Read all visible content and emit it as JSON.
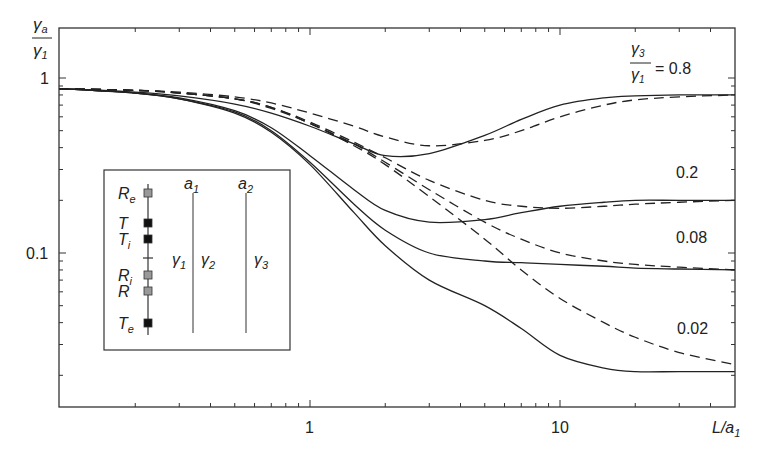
{
  "chart_data": {
    "type": "line",
    "title": "",
    "xlabel": "L/a1",
    "ylabel": "γa/γ1",
    "xscale": "log",
    "yscale": "log",
    "xlim": [
      0.1,
      50
    ],
    "ylim": [
      0.013,
      1.9
    ],
    "x_ticks": [
      "1",
      "10"
    ],
    "y_ticks": [
      "1",
      "0.1"
    ],
    "grid": false,
    "legend_title": "γ3/γ1 =",
    "x": [
      0.1,
      0.2,
      0.3,
      0.5,
      0.7,
      1,
      1.5,
      2,
      3,
      5,
      7,
      10,
      15,
      20,
      30,
      50
    ],
    "series": [
      {
        "name": "γ3/γ1 = 0.8 (solid)",
        "style": "solid",
        "values": [
          0.87,
          0.83,
          0.79,
          0.71,
          0.63,
          0.53,
          0.42,
          0.36,
          0.37,
          0.47,
          0.58,
          0.7,
          0.77,
          0.79,
          0.8,
          0.8
        ]
      },
      {
        "name": "γ3/γ1 = 0.8 (dashed)",
        "style": "dashed",
        "values": [
          0.87,
          0.85,
          0.83,
          0.78,
          0.72,
          0.63,
          0.53,
          0.46,
          0.41,
          0.44,
          0.5,
          0.6,
          0.7,
          0.75,
          0.78,
          0.8
        ]
      },
      {
        "name": "γ3/γ1 = 0.2 (solid)",
        "style": "solid",
        "values": [
          0.87,
          0.82,
          0.77,
          0.65,
          0.52,
          0.36,
          0.23,
          0.175,
          0.15,
          0.155,
          0.17,
          0.185,
          0.195,
          0.2,
          0.2,
          0.2
        ]
      },
      {
        "name": "γ3/γ1 = 0.2 (dashed)",
        "style": "dashed",
        "values": [
          0.87,
          0.85,
          0.82,
          0.76,
          0.68,
          0.56,
          0.43,
          0.35,
          0.26,
          0.2,
          0.185,
          0.18,
          0.185,
          0.19,
          0.195,
          0.2
        ]
      },
      {
        "name": "γ3/γ1 = 0.08 (solid)",
        "style": "solid",
        "values": [
          0.87,
          0.82,
          0.76,
          0.64,
          0.5,
          0.33,
          0.19,
          0.135,
          0.1,
          0.09,
          0.088,
          0.086,
          0.084,
          0.082,
          0.081,
          0.08
        ]
      },
      {
        "name": "γ3/γ1 = 0.08 (dashed)",
        "style": "dashed",
        "values": [
          0.87,
          0.85,
          0.82,
          0.76,
          0.68,
          0.55,
          0.42,
          0.33,
          0.23,
          0.15,
          0.12,
          0.1,
          0.09,
          0.086,
          0.083,
          0.08
        ]
      },
      {
        "name": "γ3/γ1 = 0.02 (solid)",
        "style": "solid",
        "values": [
          0.87,
          0.82,
          0.76,
          0.63,
          0.49,
          0.32,
          0.17,
          0.11,
          0.07,
          0.05,
          0.037,
          0.026,
          0.022,
          0.021,
          0.021,
          0.021
        ]
      },
      {
        "name": "γ3/γ1 = 0.02 (dashed)",
        "style": "dashed",
        "values": [
          0.87,
          0.85,
          0.82,
          0.76,
          0.67,
          0.55,
          0.41,
          0.32,
          0.21,
          0.12,
          0.08,
          0.055,
          0.04,
          0.033,
          0.027,
          0.023
        ]
      }
    ],
    "annotations": [
      "γ3/γ1 = 0.8",
      "0.2",
      "0.08",
      "0.02"
    ],
    "inset": {
      "markers": [
        {
          "label": "Re",
          "fill": "gray"
        },
        {
          "label": "T",
          "fill": "black"
        },
        {
          "label": "Ti",
          "fill": "black"
        },
        {
          "label": "Ri",
          "fill": "gray"
        },
        {
          "label": "R",
          "fill": "gray"
        },
        {
          "label": "Te",
          "fill": "black"
        }
      ],
      "boundaries": [
        "a1",
        "a2"
      ],
      "regions": [
        "γ1",
        "γ2",
        "γ3"
      ]
    }
  },
  "labels": {
    "y_num": "γ",
    "y_num_sub": "a",
    "y_den": "γ",
    "y_den_sub": "1",
    "x_main": "L/a",
    "x_sub": "1",
    "x_tick_1": "1",
    "x_tick_10": "10",
    "y_tick_1": "1",
    "y_tick_01": "0.1",
    "legend_num": "γ",
    "legend_num_sub": "3",
    "legend_den": "γ",
    "legend_den_sub": "1",
    "legend_eq": "= 0.8",
    "ann_02": "0.2",
    "ann_008": "0.08",
    "ann_002": "0.02"
  },
  "inset": {
    "marker_labels": [
      {
        "main": "R",
        "sub": "e"
      },
      {
        "main": "T",
        "sub": ""
      },
      {
        "main": "T",
        "sub": "i"
      },
      {
        "main": "R",
        "sub": "i"
      },
      {
        "main": "R",
        "sub": ""
      },
      {
        "main": "T",
        "sub": "e"
      }
    ],
    "a1": {
      "main": "a",
      "sub": "1"
    },
    "a2": {
      "main": "a",
      "sub": "2"
    },
    "g1": {
      "main": "γ",
      "sub": "1"
    },
    "g2": {
      "main": "γ",
      "sub": "2"
    },
    "g3": {
      "main": "γ",
      "sub": "3"
    },
    "colors": {
      "gray": "#999999",
      "black": "#111111"
    }
  }
}
